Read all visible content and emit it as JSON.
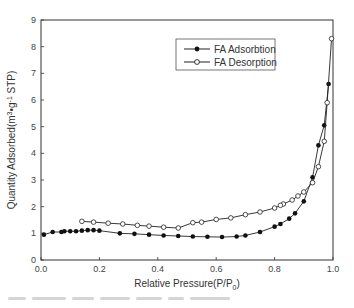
{
  "chart_data": {
    "type": "line",
    "title": "",
    "xlabel": "Relative Pressure(P/P0)",
    "xlabel_main": "Relative Pressure(P/P",
    "xlabel_sub": "0",
    "xlabel_end": ")",
    "ylabel": "Quantity Adsorbed(m3•g-1 STP)",
    "xlim": [
      0.0,
      1.0
    ],
    "ylim": [
      0,
      9
    ],
    "xticks": [
      "0.0",
      "0.2",
      "0.4",
      "0.6",
      "0.8",
      "1.0"
    ],
    "yticks": [
      "0",
      "1",
      "2",
      "3",
      "4",
      "5",
      "6",
      "7",
      "8",
      "9"
    ],
    "grid": false,
    "legend_position": "upper center-right (inside box)",
    "series": [
      {
        "name": "FA Adsorbtion",
        "marker": "filled-circle",
        "color": "#111111",
        "x": [
          0.01,
          0.04,
          0.07,
          0.08,
          0.1,
          0.12,
          0.14,
          0.16,
          0.18,
          0.2,
          0.27,
          0.32,
          0.37,
          0.42,
          0.47,
          0.52,
          0.57,
          0.62,
          0.67,
          0.7,
          0.75,
          0.8,
          0.82,
          0.85,
          0.87,
          0.9,
          0.93,
          0.95,
          0.97,
          0.985
        ],
        "y": [
          0.95,
          1.05,
          1.05,
          1.08,
          1.08,
          1.08,
          1.1,
          1.12,
          1.12,
          1.1,
          1.0,
          0.98,
          0.95,
          0.92,
          0.9,
          0.88,
          0.87,
          0.86,
          0.88,
          0.92,
          1.05,
          1.25,
          1.35,
          1.55,
          1.75,
          2.2,
          3.1,
          4.3,
          5.05,
          6.6
        ]
      },
      {
        "name": "FA Desorption",
        "marker": "open-circle",
        "color": "#111111",
        "x": [
          0.995,
          0.98,
          0.97,
          0.95,
          0.93,
          0.9,
          0.88,
          0.86,
          0.83,
          0.82,
          0.8,
          0.75,
          0.7,
          0.65,
          0.6,
          0.55,
          0.52,
          0.47,
          0.42,
          0.37,
          0.33,
          0.28,
          0.23,
          0.18,
          0.14
        ],
        "y": [
          8.3,
          5.9,
          4.45,
          3.5,
          2.9,
          2.55,
          2.4,
          2.25,
          2.1,
          2.05,
          1.95,
          1.8,
          1.7,
          1.58,
          1.52,
          1.42,
          1.4,
          1.2,
          1.23,
          1.27,
          1.3,
          1.35,
          1.38,
          1.42,
          1.45
        ]
      }
    ]
  },
  "legend": {
    "items": [
      {
        "label": "FA Adsorbtion",
        "marker": "filled-circle"
      },
      {
        "label": "FA Desorption",
        "marker": "open-circle"
      }
    ]
  },
  "axes": {
    "ylabel_main": "Quantity Adsorbed(m",
    "ylabel_sup1": "3",
    "ylabel_mid": "•g",
    "ylabel_sup2": "-1",
    "ylabel_end": " STP)"
  }
}
